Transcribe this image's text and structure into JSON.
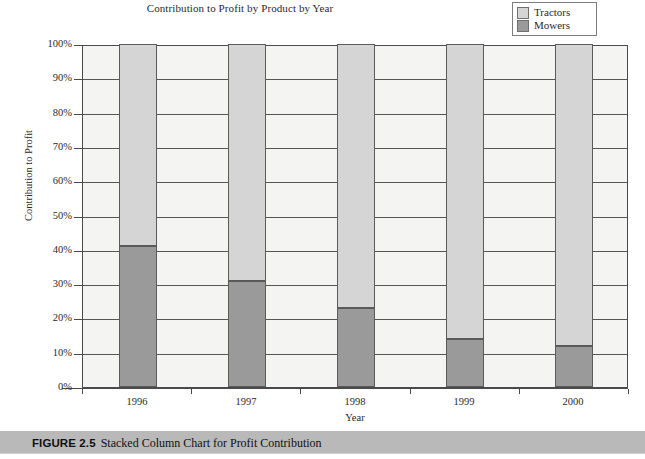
{
  "chart": {
    "title": "Contribution to Profit by Product by Year",
    "xlabel": "Year",
    "ylabel": "Contribution to Profit"
  },
  "legend": {
    "items": [
      {
        "label": "Tractors",
        "color": "#d5d5d5"
      },
      {
        "label": "Mowers",
        "color": "#9a9a9a"
      }
    ]
  },
  "caption": {
    "figure_number": "FIGURE 2.5",
    "text": "Stacked Column Chart for Profit Contribution"
  },
  "chart_data": {
    "type": "bar",
    "stacked": true,
    "title": "Contribution to Profit by Product by Year",
    "xlabel": "Year",
    "ylabel": "Contribution to Profit",
    "categories": [
      "1996",
      "1997",
      "1998",
      "1999",
      "2000"
    ],
    "series": [
      {
        "name": "Mowers",
        "color": "#9a9a9a",
        "values": [
          41,
          31,
          23,
          14,
          12
        ]
      },
      {
        "name": "Tractors",
        "color": "#d5d5d5",
        "values": [
          59,
          69,
          77,
          86,
          88
        ]
      }
    ],
    "ylim": [
      0,
      100
    ],
    "yticks": [
      "0%",
      "10%",
      "20%",
      "30%",
      "40%",
      "50%",
      "60%",
      "70%",
      "80%",
      "90%",
      "100%"
    ],
    "ytick_values": [
      0,
      10,
      20,
      30,
      40,
      50,
      60,
      70,
      80,
      90,
      100
    ],
    "grid": true,
    "grid_axis": "y",
    "legend_position": "top-right",
    "value_unit": "percent"
  }
}
